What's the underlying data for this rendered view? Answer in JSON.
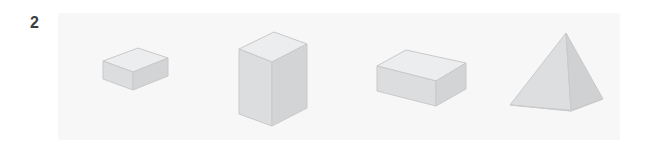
{
  "question": {
    "number_label": "2",
    "number_color": "#3c3c3c"
  },
  "panel": {
    "background_color": "#f7f7f8",
    "x": 58,
    "y": 13,
    "width": 562,
    "height": 127
  },
  "figure": {
    "projection": "isometric",
    "stroke_color": "#c9c9c9",
    "face_colors": {
      "top": "#ebebec",
      "left": "#dcdcdd",
      "right": "#d2d2d3"
    },
    "shapes": [
      {
        "index": 1,
        "name": "flat-rectangular-prism",
        "label": "flat cuboid",
        "center_x": 122,
        "center_y": 78
      },
      {
        "index": 2,
        "name": "tall-rectangular-prism",
        "label": "tall box",
        "center_x": 268,
        "center_y": 72
      },
      {
        "index": 3,
        "name": "long-rectangular-prism",
        "label": "elongated prism",
        "center_x": 413,
        "center_y": 76
      },
      {
        "index": 4,
        "name": "square-pyramid",
        "label": "pyramid",
        "center_x": 548,
        "center_y": 74
      }
    ]
  }
}
